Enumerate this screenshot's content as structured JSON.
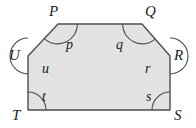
{
  "figure": {
    "name": "hexagon-angle-diagram",
    "shape_type": "hexagon",
    "fill_color": "#e2e2e2",
    "stroke_color": "#4d4d4d",
    "arc_color": "#4d4d4d",
    "background_color": "#ffffff",
    "stroke_width": 1.4,
    "arc_width": 1.1,
    "polygon_points": "58,24 142,24 170,56 170,110 28,110 28,56",
    "vertices": [
      {
        "id": "P",
        "label": "P",
        "x": 58,
        "y": 24,
        "label_x": 49,
        "label_y": 4,
        "arc_path": "M 77.5,24 A 20,20 0 0 1 44.6,39.2",
        "angle_label": "p",
        "angle_x": 66,
        "angle_y": 38
      },
      {
        "id": "Q",
        "label": "Q",
        "x": 142,
        "y": 24,
        "label_x": 145,
        "label_y": 4,
        "arc_path": "M 155.4,39.2 A 20,20 0 0 1 122.5,24",
        "angle_label": "q",
        "angle_x": 116,
        "angle_y": 38
      },
      {
        "id": "R",
        "label": "R",
        "x": 170,
        "y": 56,
        "label_x": 174,
        "label_y": 48,
        "arc_path": "M 170,38 A 18,18 0 0 1 170,74",
        "angle_label": "r",
        "angle_x": 145,
        "angle_y": 62
      },
      {
        "id": "S",
        "label": "S",
        "x": 170,
        "y": 110,
        "label_x": 174,
        "label_y": 108,
        "arc_path": "M 152,110 A 18,18 0 0 1 170,92",
        "angle_label": "s",
        "angle_x": 146,
        "angle_y": 90
      },
      {
        "id": "T",
        "label": "T",
        "x": 28,
        "y": 110,
        "label_x": 12,
        "label_y": 108,
        "arc_path": "M 28,92 A 18,18 0 0 1 46,110",
        "angle_label": "t",
        "angle_x": 42,
        "angle_y": 90
      },
      {
        "id": "U",
        "label": "U",
        "x": 28,
        "y": 56,
        "label_x": 9,
        "label_y": 48,
        "arc_path": "M 28,74 A 18,18 0 0 1 28,38",
        "angle_label": "u",
        "angle_x": 42,
        "angle_y": 62
      }
    ]
  }
}
